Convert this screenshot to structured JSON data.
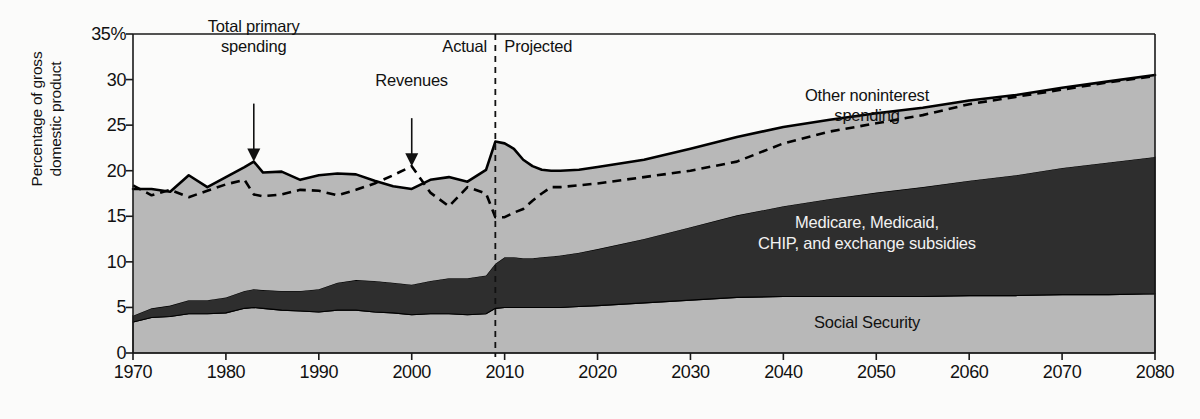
{
  "chart_data": {
    "type": "area",
    "title": "",
    "xlabel": "",
    "ylabel_line1": "Percentage of gross",
    "ylabel_line2": "domestic product",
    "xlim": [
      1970,
      2080
    ],
    "ylim": [
      0,
      35
    ],
    "grid": false,
    "legend_position": "inline-labels",
    "ytick_labels": [
      "35%",
      "30",
      "25",
      "20",
      "15",
      "10",
      "5",
      "0"
    ],
    "ytick_values": [
      35,
      30,
      25,
      20,
      15,
      10,
      5,
      0
    ],
    "xtick_labels": [
      "1970",
      "1980",
      "1990",
      "2000",
      "2010",
      "2020",
      "2030",
      "2040",
      "2050",
      "2060",
      "2070",
      "2080"
    ],
    "xtick_values": [
      1970,
      1980,
      1990,
      2000,
      2010,
      2020,
      2030,
      2040,
      2050,
      2060,
      2070,
      2080
    ],
    "divider_year": 2009,
    "period_left_label": "Actual",
    "period_right_label": "Projected",
    "annotations": [
      {
        "text_line1": "Total primary",
        "text_line2": "spending",
        "target_year": 1983,
        "target_value": 21.0
      },
      {
        "text_line1": "Revenues",
        "text_line2": "",
        "target_year": 2000,
        "target_value": 20.5
      }
    ],
    "band_labels": [
      {
        "name": "other-noninterest-spending",
        "line1": "Other noninterest",
        "line2": "spending",
        "year": 2047,
        "value": 27.0,
        "color": "#b8b8b8"
      },
      {
        "name": "medicare-medicaid-chip",
        "line1": "Medicare, Medicaid,",
        "line2": "CHIP, and exchange subsidies",
        "year": 2047,
        "value": 13.0,
        "color": "#2e2e2e"
      },
      {
        "name": "social-security",
        "line1": "Social Security",
        "line2": "",
        "year": 2047,
        "value": 3.3,
        "color": "#b8b8b8"
      }
    ],
    "colors": {
      "band_light": "#b8b8b8",
      "band_dark": "#2e2e2e",
      "line": "#000000",
      "axis": "#1a1a1a",
      "background": "#fbfbfa"
    },
    "x": [
      1970,
      1972,
      1974,
      1976,
      1978,
      1980,
      1982,
      1983,
      1984,
      1986,
      1988,
      1990,
      1992,
      1994,
      1996,
      1998,
      2000,
      2002,
      2004,
      2006,
      2008,
      2009,
      2010,
      2011,
      2012,
      2013,
      2014,
      2015,
      2016,
      2018,
      2020,
      2025,
      2030,
      2035,
      2040,
      2045,
      2050,
      2055,
      2060,
      2065,
      2070,
      2075,
      2080
    ],
    "series": [
      {
        "name": "Social Security",
        "stack_order": 1,
        "values": [
          3.4,
          3.9,
          4.0,
          4.3,
          4.3,
          4.4,
          4.9,
          5.0,
          4.9,
          4.7,
          4.6,
          4.5,
          4.7,
          4.7,
          4.5,
          4.4,
          4.2,
          4.3,
          4.3,
          4.2,
          4.3,
          4.9,
          5.0,
          5.0,
          5.0,
          5.0,
          5.0,
          5.0,
          5.0,
          5.1,
          5.2,
          5.5,
          5.8,
          6.1,
          6.2,
          6.2,
          6.2,
          6.2,
          6.3,
          6.3,
          6.4,
          6.4,
          6.5
        ]
      },
      {
        "name": "Medicare, Medicaid, CHIP, and exchange subsidies",
        "stack_order": 2,
        "values": [
          0.7,
          1.0,
          1.2,
          1.5,
          1.5,
          1.7,
          1.9,
          2.0,
          2.0,
          2.1,
          2.2,
          2.5,
          3.0,
          3.3,
          3.4,
          3.3,
          3.3,
          3.6,
          3.9,
          4.0,
          4.2,
          4.9,
          5.5,
          5.5,
          5.4,
          5.4,
          5.5,
          5.6,
          5.7,
          5.9,
          6.2,
          7.0,
          8.0,
          9.0,
          9.9,
          10.7,
          11.4,
          12.0,
          12.6,
          13.2,
          13.9,
          14.5,
          15.0
        ]
      },
      {
        "name": "Other noninterest spending",
        "stack_order": 3,
        "values": [
          13.9,
          13.1,
          12.5,
          13.7,
          12.4,
          13.2,
          13.6,
          14.0,
          12.9,
          13.1,
          12.2,
          12.5,
          12.0,
          11.6,
          11.0,
          10.6,
          10.5,
          11.1,
          11.1,
          10.6,
          11.6,
          13.4,
          12.5,
          11.9,
          10.8,
          10.1,
          9.6,
          9.4,
          9.3,
          9.1,
          9.0,
          8.7,
          8.6,
          8.6,
          8.7,
          8.7,
          8.7,
          8.7,
          8.8,
          8.8,
          8.8,
          8.9,
          9.0
        ]
      }
    ],
    "total_primary_spending": {
      "name": "Total primary spending",
      "style": "solid",
      "values": [
        18.0,
        18.0,
        17.7,
        19.5,
        18.2,
        19.3,
        20.4,
        21.0,
        19.8,
        19.9,
        19.0,
        19.5,
        19.7,
        19.6,
        18.9,
        18.3,
        18.0,
        19.0,
        19.3,
        18.8,
        20.1,
        23.2,
        23.0,
        22.4,
        21.2,
        20.5,
        20.1,
        20.0,
        20.0,
        20.1,
        20.4,
        21.2,
        22.4,
        23.7,
        24.8,
        25.6,
        26.3,
        26.9,
        27.7,
        28.3,
        29.1,
        29.8,
        30.5
      ]
    },
    "revenues": {
      "name": "Revenues",
      "style": "dashed",
      "values": [
        18.4,
        17.3,
        17.9,
        17.1,
        17.8,
        18.5,
        19.0,
        17.4,
        17.2,
        17.4,
        17.9,
        17.8,
        17.3,
        17.9,
        18.6,
        19.5,
        20.5,
        17.6,
        16.1,
        18.2,
        17.5,
        14.9,
        14.9,
        15.4,
        15.8,
        16.7,
        17.5,
        18.2,
        18.2,
        18.4,
        18.6,
        19.3,
        20.0,
        21.0,
        23.0,
        24.3,
        25.2,
        26.1,
        27.3,
        28.1,
        28.9,
        29.7,
        30.4
      ]
    }
  }
}
